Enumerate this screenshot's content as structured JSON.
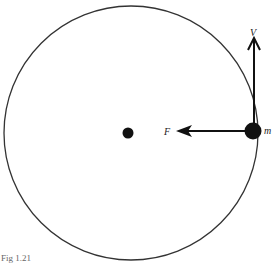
{
  "figure": {
    "caption": "Fig 1.21",
    "labels": {
      "velocity": "V",
      "force": "F",
      "mass": "m"
    },
    "colors": {
      "stroke": "#222222",
      "background": "#ffffff"
    }
  }
}
